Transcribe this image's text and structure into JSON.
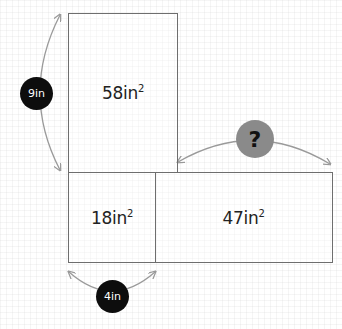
{
  "diagram": {
    "regions": [
      {
        "id": "top",
        "area_value": "58in",
        "exponent": "2"
      },
      {
        "id": "bottom-left",
        "area_value": "18in",
        "exponent": "2"
      },
      {
        "id": "bottom-right",
        "area_value": "47in",
        "exponent": "2"
      }
    ],
    "dimensions": {
      "height_label": "9in",
      "width_label": "4in",
      "unknown_label": "?"
    },
    "colors": {
      "stroke": "#6e6e6e",
      "arrow": "#999999",
      "dark_badge": "#0d0d0d",
      "question_badge": "#8a8a8a"
    }
  }
}
